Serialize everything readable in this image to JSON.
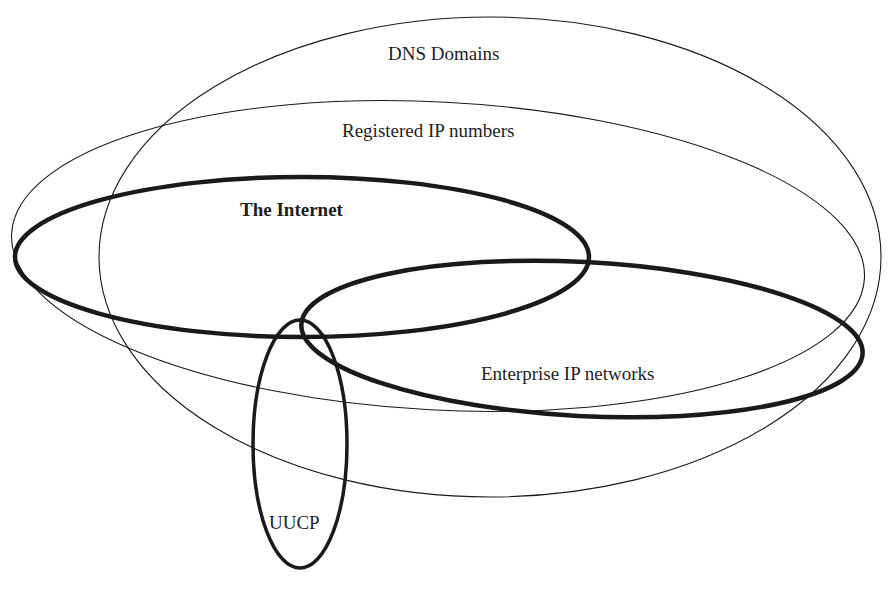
{
  "diagram": {
    "type": "venn-ellipses",
    "background": "#ffffff",
    "stroke_color": "#1a1a1a",
    "sets": [
      {
        "id": "dns",
        "label": "DNS Domains",
        "bold": false,
        "ellipse": {
          "cx": 490,
          "cy": 257,
          "rx": 391,
          "ry": 240,
          "rot": 0,
          "stroke_width": 1.1
        },
        "label_pos": {
          "x": 388,
          "y": 44
        }
      },
      {
        "id": "registered-ip",
        "label": "Registered IP numbers",
        "bold": false,
        "ellipse": {
          "cx": 438,
          "cy": 256,
          "rx": 427,
          "ry": 154,
          "rot": 3,
          "stroke_width": 1.1
        },
        "label_pos": {
          "x": 342,
          "y": 121
        }
      },
      {
        "id": "internet",
        "label": "The Internet",
        "bold": true,
        "ellipse": {
          "cx": 302,
          "cy": 257,
          "rx": 287,
          "ry": 80,
          "rot": 0,
          "stroke_width": 4.5
        },
        "label_pos": {
          "x": 240,
          "y": 200
        }
      },
      {
        "id": "enterprise-ip",
        "label": "Enterprise IP networks",
        "bold": false,
        "ellipse": {
          "cx": 582,
          "cy": 339,
          "rx": 281,
          "ry": 77,
          "rot": 3,
          "stroke_width": 4.5
        },
        "label_pos": {
          "x": 481,
          "y": 364
        }
      },
      {
        "id": "uucp",
        "label": "UUCP",
        "bold": false,
        "ellipse": {
          "cx": 300,
          "cy": 444,
          "rx": 47,
          "ry": 124,
          "rot": 0,
          "stroke_width": 3.5
        },
        "label_pos": {
          "x": 269,
          "y": 513
        }
      }
    ]
  }
}
